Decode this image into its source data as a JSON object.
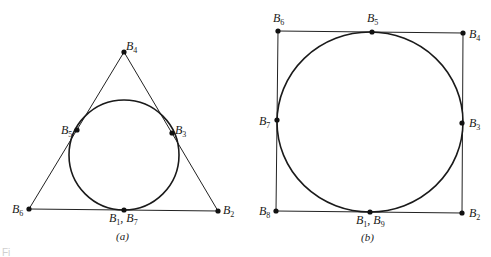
{
  "figure": {
    "footer_text": "Fi",
    "panels": [
      {
        "id": "a",
        "caption": "(a)",
        "shape": "triangle",
        "vertices": [
          "B6",
          "B4",
          "B2"
        ],
        "circle": {
          "cx": 124,
          "cy": 155,
          "r": 55
        },
        "points": [
          {
            "name": "B4",
            "base": "B",
            "sub": "4",
            "x": 124,
            "y": 52
          },
          {
            "name": "B5",
            "base": "B",
            "sub": "5",
            "x": 77,
            "y": 130
          },
          {
            "name": "B3",
            "base": "B",
            "sub": "3",
            "x": 172,
            "y": 133
          },
          {
            "name": "B6",
            "base": "B",
            "sub": "6",
            "x": 29,
            "y": 209
          },
          {
            "name": "B1, B7",
            "base": "B",
            "sub": "1",
            "base2": "B",
            "sub2": "7",
            "x": 124,
            "y": 210
          },
          {
            "name": "B2",
            "base": "B",
            "sub": "2",
            "x": 218,
            "y": 211
          }
        ]
      },
      {
        "id": "b",
        "caption": "(b)",
        "shape": "square",
        "vertices": [
          "B6",
          "B4",
          "B2",
          "B8"
        ],
        "circle": {
          "cx": 370,
          "cy": 121,
          "rx": 93,
          "ry": 90
        },
        "points": [
          {
            "name": "B6",
            "base": "B",
            "sub": "6",
            "x": 278,
            "y": 31
          },
          {
            "name": "B5",
            "base": "B",
            "sub": "5",
            "x": 372,
            "y": 32
          },
          {
            "name": "B4",
            "base": "B",
            "sub": "4",
            "x": 463,
            "y": 33
          },
          {
            "name": "B7",
            "base": "B",
            "sub": "7",
            "x": 277,
            "y": 120
          },
          {
            "name": "B3",
            "base": "B",
            "sub": "3",
            "x": 462,
            "y": 123
          },
          {
            "name": "B8",
            "base": "B",
            "sub": "8",
            "x": 276,
            "y": 211
          },
          {
            "name": "B1, B9",
            "base": "B",
            "sub": "1",
            "base2": "B",
            "sub2": "9",
            "x": 370,
            "y": 212
          },
          {
            "name": "B2",
            "base": "B",
            "sub": "2",
            "x": 462,
            "y": 213
          }
        ]
      }
    ]
  }
}
